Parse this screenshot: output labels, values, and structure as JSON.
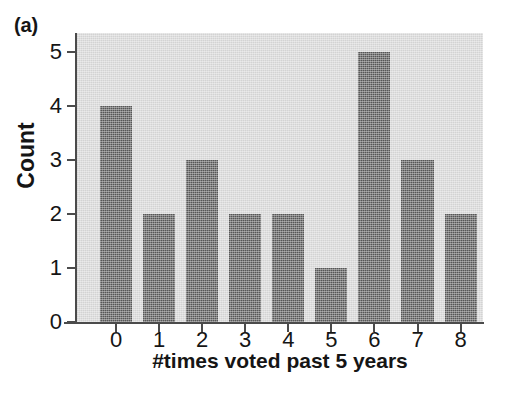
{
  "figure": {
    "panel_label": "(a)",
    "background_color": "#ffffff",
    "plot_background_color": "#d3d3d3",
    "bar_color": "#565656",
    "axis_color": "#4b4b4b",
    "text_color": "#151515"
  },
  "chart_data": {
    "type": "bar",
    "title": "(a)",
    "categories": [
      "0",
      "1",
      "2",
      "3",
      "4",
      "5",
      "6",
      "7",
      "8"
    ],
    "values": [
      4,
      2,
      3,
      2,
      2,
      1,
      5,
      3,
      2
    ],
    "xlabel": "#times voted past 5 years",
    "ylabel": "Count",
    "xtick_labels": [
      "0",
      "1",
      "2",
      "3",
      "4",
      "5",
      "6",
      "7",
      "8"
    ],
    "ytick_labels": [
      "0",
      "1",
      "2",
      "3",
      "4",
      "5"
    ],
    "ytick_values": [
      0,
      1,
      2,
      3,
      4,
      5
    ],
    "ylim": [
      0,
      5.35
    ],
    "grid": false,
    "legend": false
  }
}
